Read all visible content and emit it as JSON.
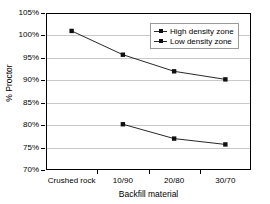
{
  "chart_data": {
    "type": "line",
    "title": "",
    "xlabel": "Backfill material",
    "ylabel": "% Proctor",
    "categories": [
      "Crushed rock",
      "10/90",
      "20/80",
      "30/70"
    ],
    "ylim": [
      70,
      105
    ],
    "ytick_values": [
      70,
      75,
      80,
      85,
      90,
      95,
      100,
      105
    ],
    "ytick_labels": [
      "70%",
      "75%",
      "80%",
      "85%",
      "90%",
      "95%",
      "100%",
      "105%"
    ],
    "grid": "horizontal",
    "legend_position": "top-right",
    "series": [
      {
        "name": "High density zone",
        "marker": "square",
        "color": "#101010",
        "values": [
          101.0,
          95.7,
          92.0,
          90.2
        ]
      },
      {
        "name": "Low density zone",
        "marker": "square",
        "color": "#101010",
        "values": [
          null,
          80.2,
          77.0,
          75.7
        ]
      }
    ]
  },
  "legend": {
    "entries": [
      {
        "label": "High density zone"
      },
      {
        "label": "Low density zone"
      }
    ]
  }
}
